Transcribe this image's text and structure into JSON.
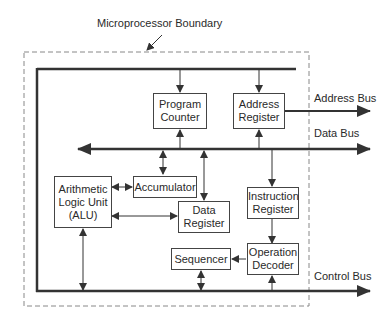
{
  "title": "Microprocessor Boundary",
  "buses": {
    "address": "Address Bus",
    "data": "Data Bus",
    "control": "Control Bus"
  },
  "blocks": {
    "program_counter": "Program Counter",
    "address_register": "Address Register",
    "accumulator": "Accumulator",
    "alu": "Arithmetic Logic Unit (ALU)",
    "data_register": "Data Register",
    "instruction_register": "Instruction Register",
    "operation_decoder": "Operation Decoder",
    "sequencer": "Sequencer"
  },
  "colors": {
    "line": "#333333",
    "boundary": "#777777"
  }
}
